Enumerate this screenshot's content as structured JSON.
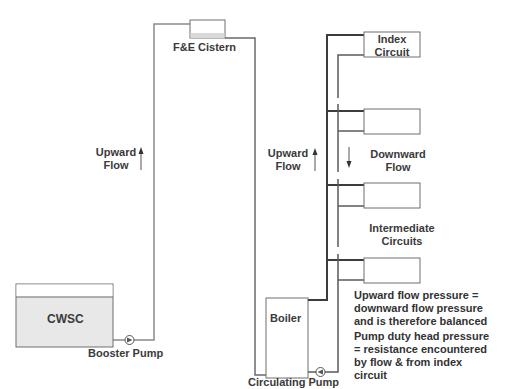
{
  "diagram": {
    "components": {
      "cistern": {
        "label": "F&E Cistern"
      },
      "cwsc": {
        "label": "CWSC"
      },
      "booster_pump": {
        "label": "Booster Pump"
      },
      "boiler": {
        "label": "Boiler"
      },
      "circulating_pump": {
        "label": "Circulating Pump"
      },
      "index_circuit": {
        "label_line1": "Index",
        "label_line2": "Circuit"
      },
      "intermediate": {
        "label_line1": "Intermediate",
        "label_line2": "Circuits"
      }
    },
    "flows": {
      "left_upward": {
        "line1": "Upward",
        "line2": "Flow"
      },
      "right_upward": {
        "line1": "Upward",
        "line2": "Flow"
      },
      "downward": {
        "line1": "Downward",
        "line2": "Flow"
      }
    },
    "notes": {
      "balance": [
        "Upward flow pressure =",
        "downward flow pressure",
        "and is therefore balanced"
      ],
      "pump_duty": [
        "Pump duty head pressure",
        "= resistance encountered",
        "by flow & from index",
        "circuit"
      ]
    },
    "colors": {
      "pipe_light": "#8a8a8a",
      "pipe_dark": "#3c3c3c",
      "box_border": "#6f6f6f",
      "tank_fill": "#e8e8e8",
      "text": "#333333"
    }
  }
}
